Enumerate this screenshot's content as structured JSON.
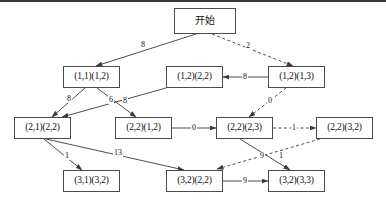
{
  "diagram": {
    "title_node": "开始",
    "nodes": [
      {
        "id": "start",
        "label": "开始",
        "x": 174,
        "y": 8,
        "w": 62,
        "h": 26,
        "cjk": true
      },
      {
        "id": "n11_12",
        "label": "(1,1)(1,2)",
        "x": 63,
        "y": 66,
        "w": 57,
        "h": 22,
        "cjk": false
      },
      {
        "id": "n12_22",
        "label": "(1,2)(2,2)",
        "x": 166,
        "y": 66,
        "w": 57,
        "h": 22,
        "cjk": false
      },
      {
        "id": "n12_13",
        "label": "(1,2)(1,3)",
        "x": 268,
        "y": 66,
        "w": 57,
        "h": 22,
        "cjk": false
      },
      {
        "id": "n21_22",
        "label": "(2,1)(2,2)",
        "x": 14,
        "y": 117,
        "w": 57,
        "h": 22,
        "cjk": false
      },
      {
        "id": "n22_12",
        "label": "(2,2)(1,2)",
        "x": 115,
        "y": 117,
        "w": 57,
        "h": 22,
        "cjk": false
      },
      {
        "id": "n22_23",
        "label": "(2,2)(2,3)",
        "x": 216,
        "y": 117,
        "w": 57,
        "h": 22,
        "cjk": false
      },
      {
        "id": "n22_32",
        "label": "(2,2)(3,2)",
        "x": 316,
        "y": 117,
        "w": 57,
        "h": 22,
        "cjk": false
      },
      {
        "id": "n31_32",
        "label": "(3,1)(3,2)",
        "x": 63,
        "y": 170,
        "w": 57,
        "h": 22,
        "cjk": false
      },
      {
        "id": "n32_22",
        "label": "(3,2)(2,2)",
        "x": 166,
        "y": 170,
        "w": 57,
        "h": 22,
        "cjk": false
      },
      {
        "id": "n32_33",
        "label": "(3,2)(3,3)",
        "x": 268,
        "y": 170,
        "w": 57,
        "h": 22,
        "cjk": false
      }
    ],
    "edges": [
      {
        "id": "e-start-11",
        "from": "start",
        "to": "n11_12",
        "weight": "8",
        "style": "solid",
        "x1": 196,
        "y1": 34,
        "x2": 96,
        "y2": 66,
        "lx": 143,
        "ly": 45
      },
      {
        "id": "e-start-1213",
        "from": "start",
        "to": "n12_13",
        "weight": "2",
        "style": "dashed",
        "x1": 212,
        "y1": 34,
        "x2": 293,
        "y2": 66,
        "lx": 248,
        "ly": 46
      },
      {
        "id": "e-1213-1222",
        "from": "n12_13",
        "to": "n12_22",
        "weight": "8",
        "style": "solid",
        "x1": 268,
        "y1": 77,
        "x2": 223,
        "y2": 77,
        "lx": 245,
        "ly": 77
      },
      {
        "id": "e-1112-2122",
        "from": "n11_12",
        "to": "n21_22",
        "weight": "8",
        "style": "solid",
        "x1": 85,
        "y1": 88,
        "x2": 52,
        "y2": 117,
        "lx": 69,
        "ly": 99
      },
      {
        "id": "e-1112-2212",
        "from": "n11_12",
        "to": "n22_12",
        "weight": "6",
        "style": "solid",
        "x1": 97,
        "y1": 88,
        "x2": 136,
        "y2": 117,
        "lx": 111,
        "ly": 100
      },
      {
        "id": "e-1222-2122",
        "from": "n12_22",
        "to": "n21_22",
        "weight": "8",
        "style": "solid",
        "x1": 166,
        "y1": 88,
        "x2": 62,
        "y2": 117,
        "lx": 125,
        "ly": 101
      },
      {
        "id": "e-1213-2223",
        "from": "n12_13",
        "to": "n22_23",
        "weight": "0",
        "style": "dashed",
        "x1": 286,
        "y1": 88,
        "x2": 249,
        "y2": 117,
        "lx": 270,
        "ly": 101
      },
      {
        "id": "e-2212-2223",
        "from": "n22_12",
        "to": "n22_23",
        "weight": "0",
        "style": "solid",
        "x1": 172,
        "y1": 128,
        "x2": 216,
        "y2": 128,
        "lx": 194,
        "ly": 128
      },
      {
        "id": "e-2223-2232",
        "from": "n22_23",
        "to": "n22_32",
        "weight": "1",
        "style": "dashed",
        "x1": 273,
        "y1": 128,
        "x2": 316,
        "y2": 128,
        "lx": 294,
        "ly": 128
      },
      {
        "id": "e-2122-3132",
        "from": "n21_22",
        "to": "n31_32",
        "weight": "1",
        "style": "solid",
        "x1": 44,
        "y1": 139,
        "x2": 82,
        "y2": 170,
        "lx": 67,
        "ly": 156
      },
      {
        "id": "e-2122-3222",
        "from": "n21_22",
        "to": "n32_22",
        "weight": "13",
        "style": "solid",
        "x1": 46,
        "y1": 139,
        "x2": 184,
        "y2": 170,
        "lx": 118,
        "ly": 153
      },
      {
        "id": "e-2223-3233",
        "from": "n22_23",
        "to": "n32_33",
        "weight": "9",
        "style": "solid",
        "x1": 240,
        "y1": 139,
        "x2": 290,
        "y2": 170,
        "lx": 262,
        "ly": 156
      },
      {
        "id": "e-2232-3222",
        "from": "n22_32",
        "to": "n32_22",
        "weight": "1",
        "style": "dashed",
        "x1": 320,
        "y1": 139,
        "x2": 217,
        "y2": 169,
        "lx": 281,
        "ly": 156
      },
      {
        "id": "e-3222-3233",
        "from": "n32_22",
        "to": "n32_33",
        "weight": "9",
        "style": "solid",
        "x1": 223,
        "y1": 181,
        "x2": 268,
        "y2": 181,
        "lx": 245,
        "ly": 181
      }
    ],
    "colors": {
      "node_border": "#4a4a4a",
      "edge_stroke": "#3a3a3a",
      "background": "#ffffff",
      "frame": "#3a3a3a"
    }
  }
}
